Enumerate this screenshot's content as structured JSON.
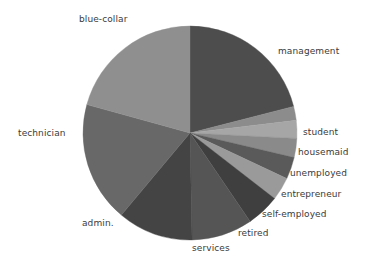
{
  "figure": {
    "background": "#ffffff",
    "width": 371,
    "height": 262
  },
  "chart_data": {
    "type": "pie",
    "title": "",
    "subtitle": "",
    "xlabel": "",
    "ylabel": "",
    "grid": false,
    "legend_position": "none",
    "label_style": "outside-radial",
    "start_angle_deg": 90,
    "direction": "clockwise",
    "center": {
      "x": 190,
      "y": 133
    },
    "radius": 107,
    "categories": [
      "management",
      "student",
      "housemaid",
      "unemployed",
      "entrepreneur",
      "self-employed",
      "retired",
      "services",
      "admin.",
      "technician",
      "blue-collar"
    ],
    "values": [
      21.0,
      2.1,
      2.7,
      2.9,
      3.3,
      3.5,
      5.0,
      9.2,
      11.4,
      18.2,
      20.7
    ],
    "units": "percent",
    "slices": [
      {
        "label": "management",
        "value": 21.0,
        "color": "#4d4d4d",
        "start_deg": 0.0,
        "end_deg": 75.6
      },
      {
        "label": "student",
        "value": 2.1,
        "color": "#8c8c8c",
        "start_deg": 75.6,
        "end_deg": 83.2
      },
      {
        "label": "housemaid",
        "value": 2.7,
        "color": "#a6a6a6",
        "start_deg": 83.2,
        "end_deg": 92.9
      },
      {
        "label": "unemployed",
        "value": 2.9,
        "color": "#8a8a8a",
        "start_deg": 92.9,
        "end_deg": 103.3
      },
      {
        "label": "entrepreneur",
        "value": 3.3,
        "color": "#5a5a5a",
        "start_deg": 103.3,
        "end_deg": 115.2
      },
      {
        "label": "self-employed",
        "value": 3.5,
        "color": "#9a9a9a",
        "start_deg": 115.2,
        "end_deg": 127.8
      },
      {
        "label": "retired",
        "value": 5.0,
        "color": "#3f3f3f",
        "start_deg": 127.8,
        "end_deg": 145.8
      },
      {
        "label": "services",
        "value": 9.2,
        "color": "#555555",
        "start_deg": 145.8,
        "end_deg": 178.9
      },
      {
        "label": "admin.",
        "value": 11.4,
        "color": "#444444",
        "start_deg": 178.9,
        "end_deg": 219.9
      },
      {
        "label": "technician",
        "value": 18.2,
        "color": "#686868",
        "start_deg": 219.9,
        "end_deg": 285.4
      },
      {
        "label": "blue-collar",
        "value": 20.7,
        "color": "#8f8f8f",
        "start_deg": 285.4,
        "end_deg": 360.0
      }
    ]
  },
  "labels": {
    "management": "management",
    "student": "student",
    "housemaid": "housemaid",
    "unemployed": "unemployed",
    "entrepreneur": "entrepreneur",
    "self_employed": "self-employed",
    "retired": "retired",
    "services": "services",
    "admin": "admin.",
    "technician": "technician",
    "blue_collar": "blue-collar"
  },
  "colors": {
    "text": "#3a3a3a",
    "background": "#ffffff",
    "edge": "#6b6b6b"
  }
}
